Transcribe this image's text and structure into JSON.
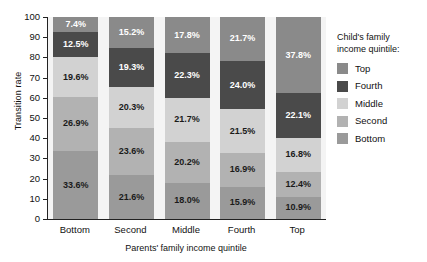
{
  "chart_data": {
    "type": "bar",
    "subtype": "stacked-bar-100",
    "title": "",
    "xlabel": "Parents' family income quintile",
    "ylabel": "Transition rate",
    "ylim": [
      0,
      100
    ],
    "yticks": [
      0,
      10,
      20,
      30,
      40,
      50,
      60,
      70,
      80,
      90,
      100
    ],
    "grid": false,
    "legend_position": "right",
    "legend_title": "Child's family income quintile:",
    "categories": [
      "Bottom",
      "Second",
      "Middle",
      "Fourth",
      "Top"
    ],
    "series": [
      {
        "name": "Bottom",
        "color": "#9a9a9a",
        "values": [
          33.6,
          21.6,
          18.0,
          15.9,
          10.9
        ]
      },
      {
        "name": "Second",
        "color": "#b2b2b2",
        "values": [
          26.9,
          23.6,
          20.2,
          16.9,
          12.4
        ]
      },
      {
        "name": "Middle",
        "color": "#d2d2d2",
        "values": [
          19.6,
          20.3,
          21.7,
          21.5,
          16.8
        ]
      },
      {
        "name": "Fourth",
        "color": "#4a4a4a",
        "values": [
          12.5,
          19.3,
          22.3,
          24.0,
          22.1
        ]
      },
      {
        "name": "Top",
        "color": "#8a8a8a",
        "values": [
          7.4,
          15.2,
          17.8,
          21.7,
          37.8
        ]
      }
    ],
    "data_labels": [
      [
        "33.6%",
        "26.9%",
        "19.6%",
        "12.5%",
        "7.4%"
      ],
      [
        "21.6%",
        "23.6%",
        "20.3%",
        "19.3%",
        "15.2%"
      ],
      [
        "18.0%",
        "20.2%",
        "21.7%",
        "22.3%",
        "17.8%"
      ],
      [
        "15.9%",
        "16.9%",
        "21.5%",
        "24.0%",
        "21.7%"
      ],
      [
        "10.9%",
        "12.4%",
        "16.8%",
        "22.1%",
        "37.8%"
      ]
    ]
  },
  "legend": {
    "title_line1": "Child's family",
    "title_line2": "income quintile:",
    "entries": [
      {
        "label": "Top",
        "color": "#8a8a8a"
      },
      {
        "label": "Fourth",
        "color": "#4a4a4a"
      },
      {
        "label": "Middle",
        "color": "#d2d2d2"
      },
      {
        "label": "Second",
        "color": "#b2b2b2"
      },
      {
        "label": "Bottom",
        "color": "#9a9a9a"
      }
    ]
  }
}
